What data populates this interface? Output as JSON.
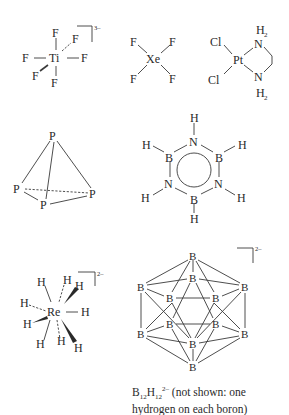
{
  "molecules": [
    {
      "id": "TiF6",
      "center": "Ti",
      "ligands": [
        "F",
        "F",
        "F",
        "F",
        "F",
        "F"
      ],
      "charge": "3–"
    },
    {
      "id": "XeF4",
      "center": "Xe",
      "ligands": [
        "F",
        "F",
        "F",
        "F"
      ]
    },
    {
      "id": "PtCl2(en)",
      "center": "Pt",
      "ligands": [
        "Cl",
        "Cl",
        "N",
        "N"
      ],
      "nh_label": "H",
      "nh_sub": "2"
    },
    {
      "id": "P4",
      "atoms": [
        "P",
        "P",
        "P",
        "P"
      ]
    },
    {
      "id": "borazine",
      "atoms": {
        "B": "B",
        "N": "N",
        "H": "H"
      }
    },
    {
      "id": "ReH9",
      "center": "Re",
      "ligand": "H",
      "charge": "2–"
    },
    {
      "id": "B12H12",
      "atom": "B",
      "charge": "2–"
    }
  ],
  "labels": {
    "Ti": "Ti",
    "F": "F",
    "Xe": "Xe",
    "Pt": "Pt",
    "Cl": "Cl",
    "N": "N",
    "H": "H",
    "P": "P",
    "B": "B",
    "Re": "Re",
    "sub2": "2",
    "charge3": "3–",
    "charge2": "2–"
  },
  "caption": {
    "formula_B": "B",
    "formula_B_sub": "12",
    "formula_H": "H",
    "formula_H_sub": "12",
    "formula_charge": "2–",
    "note": " (not shown: one hydrogen on each boron)"
  }
}
